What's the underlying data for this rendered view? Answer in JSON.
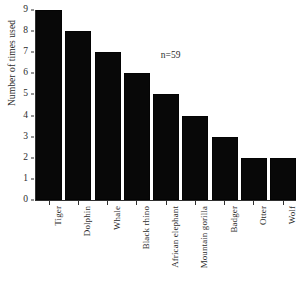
{
  "chart_data": {
    "type": "bar",
    "title": "",
    "subtitle": "",
    "xlabel": "",
    "ylabel": "Number of times used",
    "categories": [
      "Tiger",
      "Dolphin",
      "Whale",
      "Black rhino",
      "African elephant",
      "Mountain gorilla",
      "Badger",
      "Otter",
      "Wolf"
    ],
    "values": [
      9,
      8,
      7,
      6,
      5,
      4,
      3,
      2,
      2
    ],
    "ylim": [
      0,
      9
    ],
    "ytick_labels": [
      "9",
      "8",
      "7",
      "6",
      "5",
      "4",
      "3",
      "2",
      "1",
      "0"
    ],
    "ytick_values": [
      9,
      8,
      7,
      6,
      5,
      4,
      3,
      2,
      1,
      0
    ],
    "grid": false,
    "legend": false,
    "legend_position": "none",
    "annotations": [
      {
        "text": "n=59",
        "x_frac": 0.48,
        "y_value": 6.8
      }
    ],
    "bar_color": "#080808",
    "axis_color": "#2f2f2f",
    "background_color": "#ffffff",
    "xtick_label_rotation": 90
  }
}
